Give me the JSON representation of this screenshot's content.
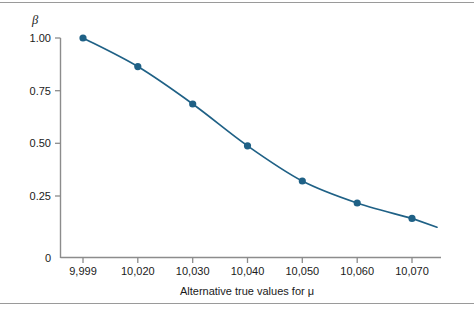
{
  "figure": {
    "background_color": "#ffffff",
    "rule_color": "#9a9a9a"
  },
  "chart_data": {
    "type": "line",
    "title": "",
    "subtitle": "",
    "xlabel": "Alternative true values for μ",
    "ylabel": "β",
    "x": [
      9999,
      10020,
      10030,
      10040,
      10050,
      10060,
      10070
    ],
    "values": [
      1.0,
      0.87,
      0.7,
      0.51,
      0.35,
      0.25,
      0.18
    ],
    "categories": [
      "9,999",
      "10,020",
      "10,030",
      "10,040",
      "10,050",
      "10,060",
      "10,070"
    ],
    "xticklabels": [
      "9,999",
      "10,020",
      "10,030",
      "10,040",
      "10,050",
      "10,060",
      "10,070"
    ],
    "yticklabels": [
      "1.00",
      "0.75",
      "0.50",
      "0.25",
      "0"
    ],
    "ytickvalues": [
      1.0,
      0.75,
      0.5,
      0.25,
      0
    ],
    "ylim": [
      0,
      1.06
    ],
    "grid": false,
    "legend": false,
    "legend_position": "none",
    "series": [
      {
        "name": "beta",
        "color": "#1f6186",
        "marker": "circle",
        "values": [
          1.0,
          0.87,
          0.7,
          0.51,
          0.35,
          0.25,
          0.18
        ]
      }
    ],
    "line_tail_extends_past_last_point": true,
    "tail_end_value": 0.14
  },
  "axes": {
    "y_axis_title": "β",
    "x_axis_title": "Alternative true values for μ",
    "zero_label": "0"
  }
}
